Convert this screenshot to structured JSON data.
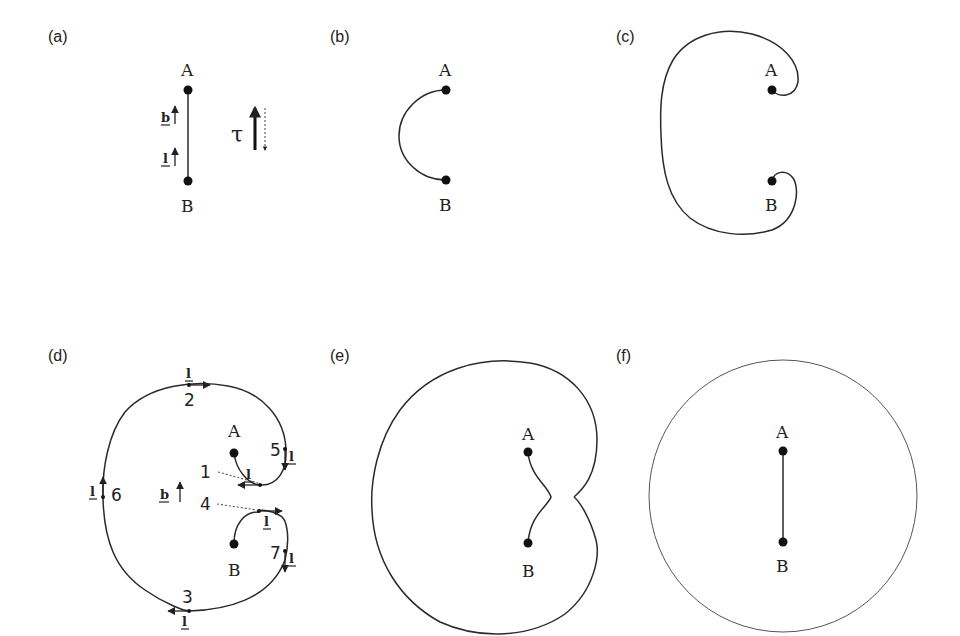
{
  "figure": {
    "panels": [
      {
        "id": "a",
        "label": "(a)",
        "node_top": "A",
        "node_bottom": "B",
        "vector_b": "b",
        "vector_l": "l",
        "tau_symbol": "τ",
        "description": "straight segment from B to A with tangent l and Burgers vector b; τ shown as opposing arrows (solid up, dotted down)"
      },
      {
        "id": "b",
        "label": "(b)",
        "node_top": "A",
        "node_bottom": "B",
        "description": "semicircular bowed segment between pinning points A and B"
      },
      {
        "id": "c",
        "label": "(c)",
        "node_top": "A",
        "node_bottom": "B",
        "description": "loop wrapped around, ends curling back near A and B"
      },
      {
        "id": "d",
        "label": "(d)",
        "node_top": "A",
        "node_bottom": "B",
        "vector_b": "b",
        "vector_l": "l",
        "points": [
          "1",
          "2",
          "3",
          "4",
          "5",
          "6",
          "7"
        ],
        "description": "loop with numbered points and local tangent vectors l"
      },
      {
        "id": "e",
        "label": "(e)",
        "node_top": "A",
        "node_bottom": "B",
        "description": "loop about to pinch off at cusp between A-B segment and outer loop"
      },
      {
        "id": "f",
        "label": "(f)",
        "node_top": "A",
        "node_bottom": "B",
        "description": "closed circular loop released, straight segment A-B restored"
      }
    ]
  }
}
